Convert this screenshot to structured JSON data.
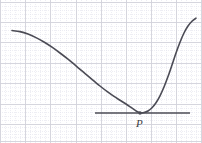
{
  "figure": {
    "width": 202,
    "height": 143,
    "background_color": "#ffffff"
  },
  "grid": {
    "major_color": "#d2d2da",
    "minor_color": "#e3e3ec",
    "major_spacing_x": 25.2,
    "major_spacing_y": 20.4,
    "minor_per_major": 5,
    "major_x_positions": [
      0.5,
      25.7,
      50.9,
      76.1,
      101.3,
      126.5,
      151.7,
      176.9,
      201.5
    ],
    "major_y_positions": [
      2.0,
      22.4,
      42.8,
      63.2,
      83.6,
      104.0,
      124.4,
      141.0
    ]
  },
  "curve": {
    "name": "parabola-curve",
    "color": "#4b4b55",
    "stroke_width": 1.6,
    "points": [
      [
        12,
        30.5
      ],
      [
        20,
        31.6
      ],
      [
        28,
        34.0
      ],
      [
        36,
        37.6
      ],
      [
        44,
        42.0
      ],
      [
        52,
        47.2
      ],
      [
        60,
        53.0
      ],
      [
        68,
        59.2
      ],
      [
        76,
        65.8
      ],
      [
        84,
        72.6
      ],
      [
        92,
        79.4
      ],
      [
        100,
        86.0
      ],
      [
        108,
        92.2
      ],
      [
        114,
        96.4
      ],
      [
        120,
        100.2
      ],
      [
        126,
        104.0
      ],
      [
        131,
        107.4
      ],
      [
        135,
        110.2
      ],
      [
        138,
        112.0
      ],
      [
        141,
        112.8
      ],
      [
        144,
        112.6
      ],
      [
        148,
        111.0
      ],
      [
        152,
        107.8
      ],
      [
        156,
        102.8
      ],
      [
        160,
        95.8
      ],
      [
        164,
        87.0
      ],
      [
        168,
        76.6
      ],
      [
        172,
        65.0
      ],
      [
        176,
        53.0
      ],
      [
        180,
        42.2
      ],
      [
        184,
        33.0
      ],
      [
        188,
        26.0
      ],
      [
        192,
        21.2
      ],
      [
        196,
        18.2
      ]
    ]
  },
  "tangent_line": {
    "name": "horizontal-tangent-line",
    "color": "#4b4b55",
    "stroke_width": 1.3,
    "x_start": 95,
    "x_end": 190,
    "y": 113.0
  },
  "tangent_point": {
    "name": "point-p",
    "label": "P",
    "x": 140,
    "y": 113.0,
    "marker_radius": 1.7,
    "marker_color": "#4b4b55",
    "label_x": 136,
    "label_y": 118
  }
}
